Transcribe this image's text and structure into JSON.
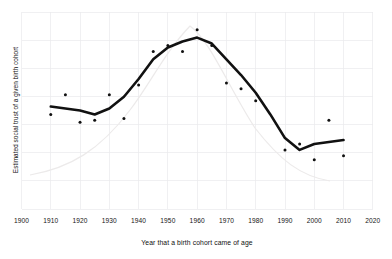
{
  "figure": {
    "background_color": "#ffffff",
    "foreground_color": "#111111",
    "gridline_color": "#e9e9ec"
  },
  "chart_data": {
    "type": "line",
    "title": "",
    "subtitle": "",
    "xlabel": "Year that a birth cohort came of age",
    "ylabel": "Estimated social trust of a given birth cohort",
    "xlim": [
      1900,
      2020
    ],
    "ylim": [
      0,
      100
    ],
    "grid": true,
    "legend": "none",
    "x_ticks": [
      1900,
      1910,
      1920,
      1930,
      1940,
      1950,
      1960,
      1970,
      1980,
      1990,
      2000,
      2010,
      2020
    ],
    "x_tick_labels": [
      "1900",
      "1910",
      "1920",
      "1930",
      "1940",
      "1950",
      "1960",
      "1970",
      "1980",
      "1990",
      "2000",
      "2010",
      "2020"
    ],
    "y_ticks": [],
    "y_tick_labels": [],
    "series": [
      {
        "name": "Smoothed trend in social trust",
        "type": "line",
        "color": "#111111",
        "x": [
          1910,
          1915,
          1920,
          1925,
          1930,
          1935,
          1940,
          1945,
          1950,
          1955,
          1960,
          1965,
          1970,
          1975,
          1980,
          1985,
          1990,
          1995,
          2000,
          2005,
          2010
        ],
        "y": [
          52,
          51,
          50,
          48,
          51,
          57,
          66,
          76,
          82,
          85,
          87,
          84,
          76,
          68,
          59,
          48,
          36,
          30,
          33,
          34,
          35
        ]
      },
      {
        "name": "Observed birth cohort estimates",
        "type": "scatter",
        "color": "#111111",
        "x": [
          1910,
          1915,
          1920,
          1925,
          1930,
          1935,
          1940,
          1945,
          1950,
          1955,
          1960,
          1965,
          1970,
          1975,
          1980,
          1990,
          1995,
          2000,
          2005,
          2010
        ],
        "y": [
          48,
          58,
          44,
          45,
          58,
          46,
          63,
          80,
          83,
          80,
          91,
          83,
          64,
          61,
          55,
          30,
          33,
          25,
          45,
          27
        ]
      }
    ],
    "annotations": []
  },
  "axes": {
    "x_axis_name": "year-axis",
    "y_axis_name": "social-trust-axis"
  }
}
